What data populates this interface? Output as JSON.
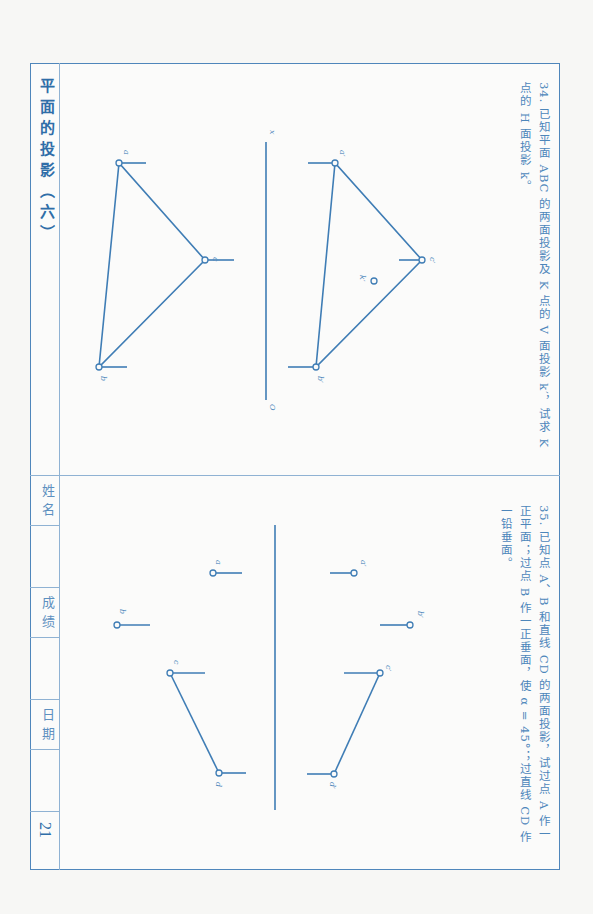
{
  "sidebar": {
    "title": "平面的投影（六）",
    "name_label": "姓名",
    "score_label": "成绩",
    "date_label": "日期",
    "page_number": "21"
  },
  "problem34": {
    "text": "34. 已知平面 ABC 的两面投影及 K 点的 V 面投影 k′，试求 K 点的 H 面投影 k。",
    "labels": {
      "a_prime": "a′",
      "b_prime": "b′",
      "c_prime": "c′",
      "k_prime": "k′",
      "a": "a",
      "b": "b",
      "c": "c",
      "x": "x",
      "o": "O"
    }
  },
  "problem35": {
    "text": "35. 已知点 A、B 和直线 CD 的两面投影，试过点 A 作一正平面；过点 B 作一正垂面，使 α = 45°；过直线 CD 作一铅垂面。",
    "labels": {
      "a_prime": "a′",
      "b_prime": "b′",
      "c_prime": "c′",
      "d_prime": "d′",
      "a": "a",
      "b": "b",
      "c": "c",
      "d": "d"
    }
  },
  "colors": {
    "line": "#3f7db5",
    "frame": "#4f86bb",
    "text": "#4d86ba"
  }
}
